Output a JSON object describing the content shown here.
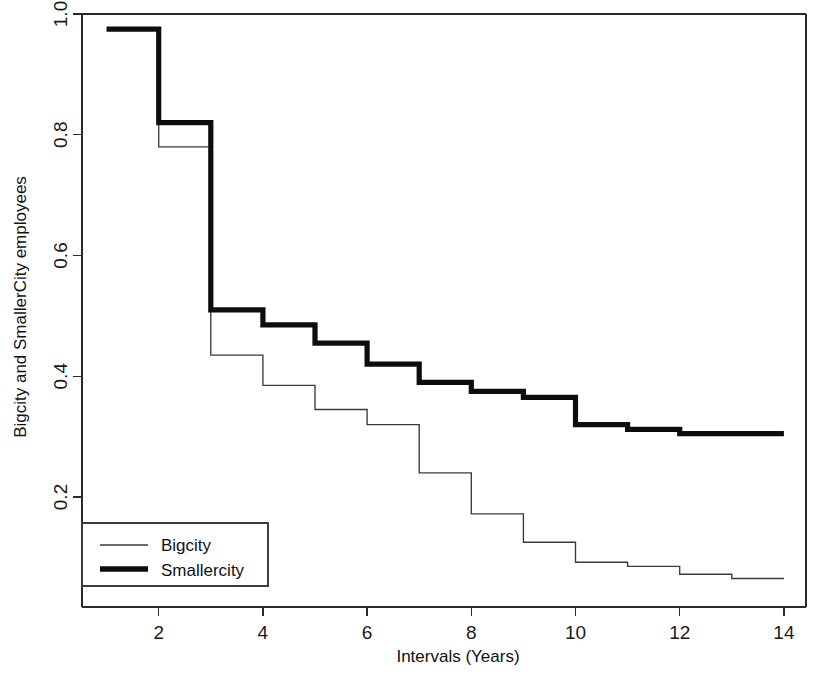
{
  "chart_data": {
    "type": "line",
    "subtype": "step",
    "title": "",
    "xlabel": "Intervals (Years)",
    "ylabel": "Bigcity and SmallerCity employees",
    "xlim": [
      1,
      14
    ],
    "ylim": [
      0.0,
      1.0
    ],
    "xticks": [
      2,
      4,
      6,
      8,
      10,
      12,
      14
    ],
    "xtick_labels": [
      "2",
      "4",
      "6",
      "8",
      "10",
      "12",
      "14"
    ],
    "yticks": [
      0.2,
      0.4,
      0.6,
      0.8,
      1.0
    ],
    "ytick_labels": [
      "0.2",
      "0.4",
      "0.6",
      "0.8",
      "1.0"
    ],
    "grid": false,
    "legend_position": "bottom-left",
    "x": [
      1,
      2,
      3,
      4,
      5,
      6,
      7,
      8,
      9,
      10,
      11,
      12,
      13,
      14
    ],
    "series": [
      {
        "name": "Bigcity",
        "style": "thin",
        "color": "#3a3a3a",
        "linewidth": 1.35,
        "values": [
          0.975,
          0.78,
          0.435,
          0.385,
          0.345,
          0.32,
          0.24,
          0.172,
          0.125,
          0.092,
          0.085,
          0.072,
          0.065,
          0.065
        ]
      },
      {
        "name": "Smallercity",
        "style": "thick",
        "color": "#0d0d0d",
        "linewidth": 5.2,
        "values": [
          0.975,
          0.82,
          0.51,
          0.485,
          0.455,
          0.42,
          0.39,
          0.375,
          0.365,
          0.32,
          0.312,
          0.305,
          0.305,
          0.305
        ]
      }
    ]
  },
  "legend": {
    "entries": [
      {
        "label": "Bigcity",
        "style": "thin"
      },
      {
        "label": "Smallercity",
        "style": "thick"
      }
    ]
  },
  "axes": {
    "x_title": "Intervals (Years)",
    "y_title": "Bigcity and SmallerCity employees"
  }
}
